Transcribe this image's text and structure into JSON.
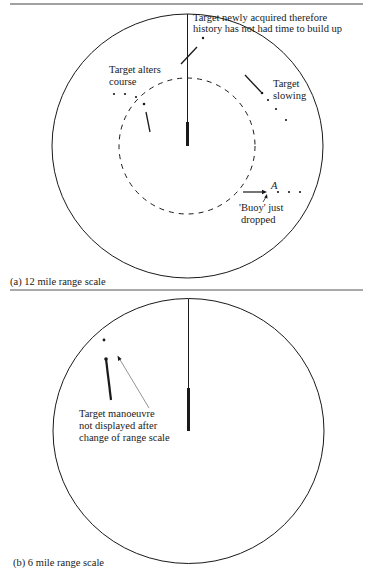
{
  "panels": [
    {
      "id": "a",
      "caption": "(a)  12 mile range scale",
      "annotations": {
        "new_target_line1": "Target newly acquired therefore",
        "new_target_line2": "history has not had time to build up",
        "alters_line1": "Target alters",
        "alters_line2": "course",
        "slowing_line1": "Target",
        "slowing_line2": "slowing",
        "point_label": "A",
        "buoy_line1": "'Buoy' just",
        "buoy_line2": "dropped"
      }
    },
    {
      "id": "b",
      "caption": "(b)  6 mile range scale",
      "annotations": {
        "manoeuvre_line1": "Target manoeuvre",
        "manoeuvre_line2": "not displayed after",
        "manoeuvre_line3": "change of range scale"
      }
    }
  ],
  "colors": {
    "ink": "#1a1a1a",
    "rule": "#555555",
    "background": "#ffffff"
  }
}
